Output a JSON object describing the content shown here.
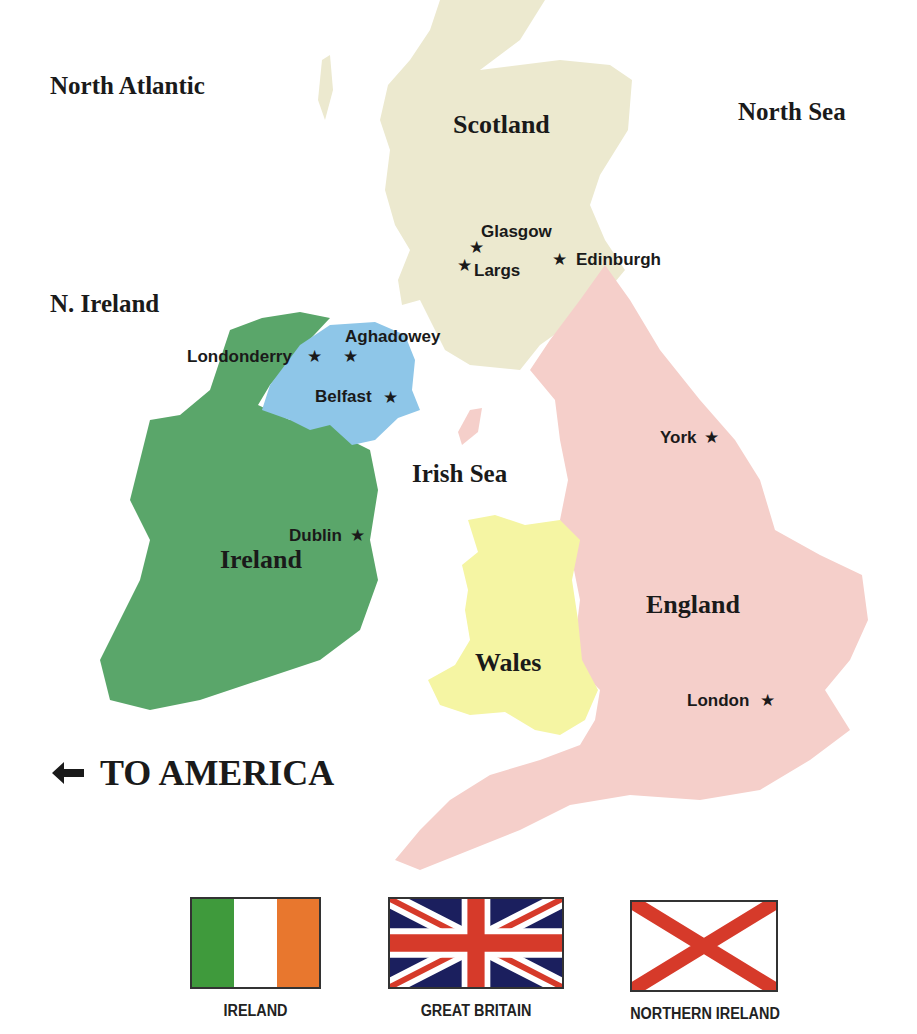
{
  "seas": {
    "north_atlantic": "North Atlantic",
    "north_sea": "North Sea",
    "irish_sea": "Irish Sea"
  },
  "regions": {
    "scotland": "Scotland",
    "n_ireland": "N. Ireland",
    "ireland": "Ireland",
    "wales": "Wales",
    "england": "England"
  },
  "cities": [
    {
      "name": "Glasgow",
      "star": "★"
    },
    {
      "name": "Largs",
      "star": "★"
    },
    {
      "name": "Edinburgh",
      "star": "★"
    },
    {
      "name": "Londonderry",
      "star": "★"
    },
    {
      "name": "Aghadowey",
      "star": "★"
    },
    {
      "name": "Belfast",
      "star": "★"
    },
    {
      "name": "York",
      "star": "★"
    },
    {
      "name": "Dublin",
      "star": "★"
    },
    {
      "name": "London",
      "star": "★"
    }
  ],
  "america": {
    "arrow": "🡐",
    "label": "TO AMERICA"
  },
  "flags": [
    {
      "name": "IRELAND"
    },
    {
      "name": "GREAT BRITAIN"
    },
    {
      "name": "NORTHERN IRELAND"
    }
  ],
  "colors": {
    "scotland": "#ece9cf",
    "northern_ireland": "#8ec6e8",
    "ireland": "#5aa66a",
    "wales": "#f5f5a3",
    "england": "#f5cfca",
    "ireland_flag_green": "#3f9a3c",
    "ireland_flag_orange": "#e8772e",
    "uk_blue": "#1b1f5e",
    "uk_red": "#d63a2a"
  }
}
